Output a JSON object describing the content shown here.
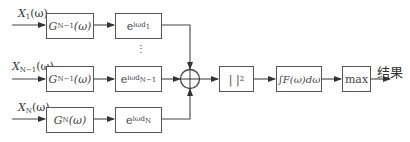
{
  "inputs": [
    {
      "label": "X",
      "sub": "1",
      "arg": "(ω)"
    },
    {
      "label": "X",
      "sub": "N−1",
      "arg": "(ω)"
    },
    {
      "label": "X",
      "sub": "N",
      "arg": "(ω)"
    }
  ],
  "filters": [
    {
      "label": "G",
      "sub": "N−1",
      "arg": "(ω)"
    },
    {
      "label": "G",
      "sub": "N−1",
      "arg": "(ω)"
    },
    {
      "label": "G",
      "sub": "N",
      "arg": "(ω)"
    }
  ],
  "phases": [
    {
      "base": "e",
      "exp": "iωd",
      "sub": "1"
    },
    {
      "base": "e",
      "exp": "iωd",
      "sub": "N−1"
    },
    {
      "base": "e",
      "exp": "iωd",
      "sub": "N"
    }
  ],
  "ellipsis": "⋮",
  "summer": "sum-node",
  "magnitude_box": {
    "label": "|  |",
    "sup": "2"
  },
  "integral_box": {
    "label": "∫F(ω)dω"
  },
  "max_box": {
    "label": "max"
  },
  "output_label": "结果"
}
